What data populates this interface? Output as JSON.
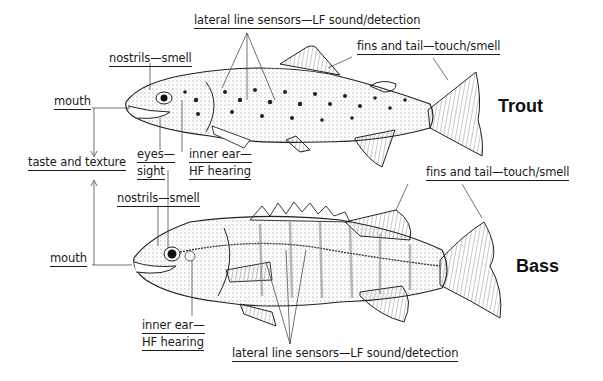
{
  "diagram": {
    "fish": [
      {
        "name": "Trout",
        "labels": {
          "lateral_line": "lateral  line sensors—LF sound/detection",
          "fins_tail": "fins and tail—touch/smell",
          "nostrils": "nostrils—smell",
          "mouth": "mouth",
          "eyes_1": "eyes—",
          "eyes_2": "sight",
          "inner_ear_1": "inner ear—",
          "inner_ear_2": "HF hearing"
        }
      },
      {
        "name": "Bass",
        "labels": {
          "lateral_line": "lateral line sensors—LF sound/detection",
          "fins_tail": "fins and tail—touch/smell",
          "nostrils": "nostrils—smell",
          "mouth": "mouth",
          "inner_ear_1": "inner ear—",
          "inner_ear_2": "HF hearing"
        }
      }
    ],
    "shared_label": "taste and texture"
  }
}
